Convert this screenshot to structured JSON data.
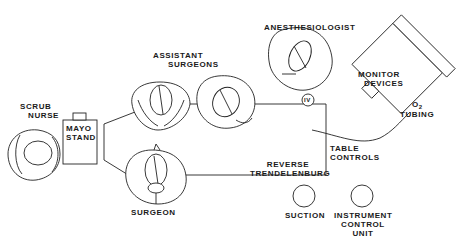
{
  "diagram": {
    "colors": {
      "line": "#222222",
      "background": "#ffffff"
    },
    "roles": {
      "anesthesiologist": "ANESTHESIOLOGIST",
      "assistant_surgeons": [
        "ASSISTANT",
        "SURGEONS"
      ],
      "scrub_nurse": [
        "SCRUB",
        "NURSE"
      ],
      "surgeon": "SURGEON"
    },
    "equipment": {
      "mayo_stand": [
        "MAYO",
        "STAND"
      ],
      "monitor_devices": [
        "MONITOR",
        "DEVICES"
      ],
      "o2_tubing": {
        "o": "O",
        "sub": "2",
        "label": "TUBING"
      },
      "iv": "IV",
      "table_controls": [
        "TABLE",
        "CONTROLS"
      ],
      "table_position": [
        "REVERSE",
        "TRENDELENBURG"
      ],
      "suction": "SUCTION",
      "instrument_control_unit": [
        "INSTRUMENT",
        "CONTROL",
        "UNIT"
      ]
    }
  }
}
